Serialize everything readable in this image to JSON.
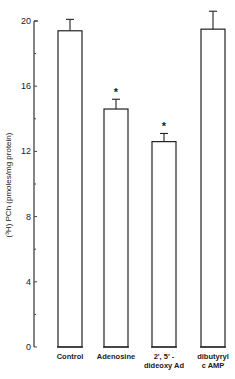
{
  "chart_data": {
    "type": "bar",
    "title": "",
    "xlabel": "",
    "ylabel": "(³H) PCh (pmoles/mg protein)",
    "ylim": [
      0,
      20
    ],
    "yticks": [
      0,
      4,
      8,
      12,
      16,
      20
    ],
    "grid": false,
    "legend": null,
    "categories": [
      "Control",
      "Adenosine",
      "2',5'-dideoxy Ad",
      "dibutyryl cAMP"
    ],
    "category_lines": [
      [
        "Control"
      ],
      [
        "Adenosine"
      ],
      [
        "2', 5' -",
        "dideoxy Ad"
      ],
      [
        "dibutyryl",
        "c AMP"
      ]
    ],
    "values": [
      19.4,
      14.6,
      12.6,
      19.5
    ],
    "error_upper": [
      20.1,
      15.2,
      13.1,
      20.6
    ],
    "annotations": [
      "",
      "*",
      "*",
      ""
    ]
  }
}
